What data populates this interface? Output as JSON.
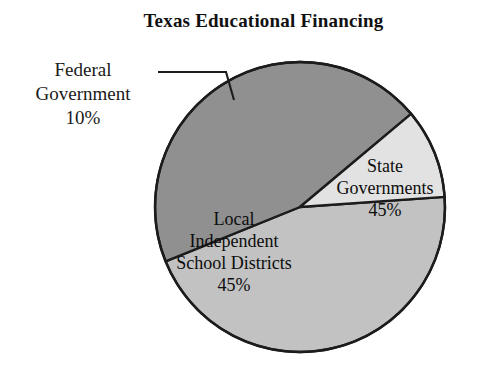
{
  "chart": {
    "title": "Texas Educational Financing"
  },
  "callout": {
    "line1": "Federal",
    "line2": "Government",
    "line3": "10%"
  },
  "slice_labels": {
    "state": {
      "line1": "State",
      "line2": "Governments",
      "line3": "45%"
    },
    "local": {
      "line1": "Local",
      "line2": "Independent",
      "line3": "School Districts",
      "line4": "45%"
    }
  },
  "chart_data": {
    "type": "pie",
    "title": "Texas Educational Financing",
    "xlabel": "",
    "ylabel": "",
    "categories": [
      "State Governments",
      "Local Independent School Districts",
      "Federal Government"
    ],
    "values": [
      45,
      45,
      10
    ],
    "value_labels": [
      "45%",
      "45%",
      "10%"
    ],
    "units": "percent",
    "total": 100,
    "legend": "none",
    "grid": false,
    "label_placement": "inside-slice for State and Local; external callout with leader line for Federal",
    "start_angle_deg": -4,
    "direction": "clockwise",
    "slices": [
      {
        "name": "State Governments",
        "value": 45,
        "label": "45%",
        "color": "#c2c2c2",
        "start_angle_deg": -4,
        "end_angle_deg": 158
      },
      {
        "name": "Local Independent School Districts",
        "value": 45,
        "label": "45%",
        "color": "#909090",
        "start_angle_deg": 158,
        "end_angle_deg": 320
      },
      {
        "name": "Federal Government",
        "value": 10,
        "label": "10%",
        "color": "#e2e2e2",
        "start_angle_deg": 320,
        "end_angle_deg": 356
      }
    ],
    "colors": {
      "state": "#c2c2c2",
      "local": "#909090",
      "federal": "#e2e2e2",
      "outline": "#1c1c1c",
      "background": "#ffffff",
      "text": "#121212"
    }
  }
}
